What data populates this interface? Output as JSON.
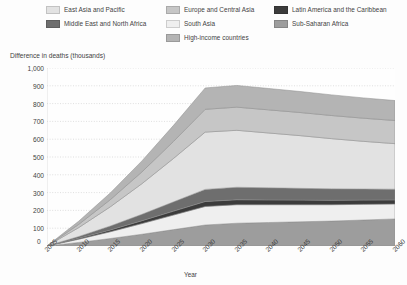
{
  "chart_data": {
    "type": "area",
    "stacked": true,
    "title": "",
    "xlabel": "Year",
    "ylabel": "Difference in deaths (thousands)",
    "x": [
      2005,
      2010,
      2015,
      2020,
      2025,
      2030,
      2035,
      2040,
      2045,
      2050,
      2055,
      2060
    ],
    "categories": [
      "2005",
      "2010",
      "2015",
      "2020",
      "2025",
      "2030",
      "2035",
      "2040",
      "2045",
      "2050",
      "2055",
      "2060"
    ],
    "xlim": [
      2005,
      2060
    ],
    "ylim": [
      0,
      1000
    ],
    "yticks": [
      "0",
      "100",
      "200",
      "300",
      "400",
      "500",
      "600",
      "700",
      "800",
      "900",
      "1,000"
    ],
    "ytick_values": [
      0,
      100,
      200,
      300,
      400,
      500,
      600,
      700,
      800,
      900,
      1000
    ],
    "grid": "horizontal-dotted",
    "legend_position": "top",
    "series": [
      {
        "name": "Sub-Saharan Africa",
        "color": "#9d9d9d",
        "values": [
          0,
          20,
          42,
          66,
          92,
          118,
          128,
          132,
          136,
          140,
          146,
          152
        ]
      },
      {
        "name": "South Asia",
        "color": "#efefef",
        "values": [
          0,
          18,
          38,
          60,
          82,
          104,
          104,
          100,
          96,
          92,
          88,
          84
        ]
      },
      {
        "name": "Latin America and the Caribbean",
        "color": "#3c3c3c",
        "values": [
          0,
          5,
          10,
          16,
          22,
          28,
          28,
          27,
          26,
          25,
          24,
          23
        ]
      },
      {
        "name": "Middle East and North Africa",
        "color": "#6e6e6e",
        "values": [
          0,
          10,
          22,
          36,
          52,
          68,
          70,
          68,
          66,
          64,
          62,
          60
        ]
      },
      {
        "name": "East Asia and Pacific",
        "color": "#e2e2e2",
        "values": [
          0,
          50,
          108,
          172,
          244,
          322,
          320,
          308,
          296,
          282,
          268,
          256
        ]
      },
      {
        "name": "Europe and Central Asia",
        "color": "#c6c6c6",
        "values": [
          0,
          18,
          40,
          66,
          96,
          128,
          130,
          130,
          130,
          130,
          130,
          130
        ]
      },
      {
        "name": "High-income countries",
        "color": "#b4b4b4",
        "values": [
          0,
          18,
          38,
          62,
          90,
          120,
          122,
          120,
          118,
          116,
          114,
          112
        ]
      }
    ],
    "totals": [
      0,
      139,
      298,
      478,
      678,
      888,
      902,
      885,
      868,
      849,
      832,
      817
    ]
  },
  "legend": {
    "items": [
      {
        "label": "East Asia and Pacific",
        "color": "#e2e2e2"
      },
      {
        "label": "Europe and Central Asia",
        "color": "#c6c6c6"
      },
      {
        "label": "Latin America and the Caribbean",
        "color": "#3c3c3c"
      },
      {
        "label": "Middle East and North Africa",
        "color": "#6e6e6e"
      },
      {
        "label": "South Asia",
        "color": "#efefef"
      },
      {
        "label": "Sub-Saharan Africa",
        "color": "#9d9d9d"
      },
      {
        "label": "High-income countries",
        "color": "#b4b4b4"
      }
    ]
  },
  "axes": {
    "y_title": "Difference in deaths (thousands)",
    "x_title": "Year",
    "zero_label": "0"
  }
}
